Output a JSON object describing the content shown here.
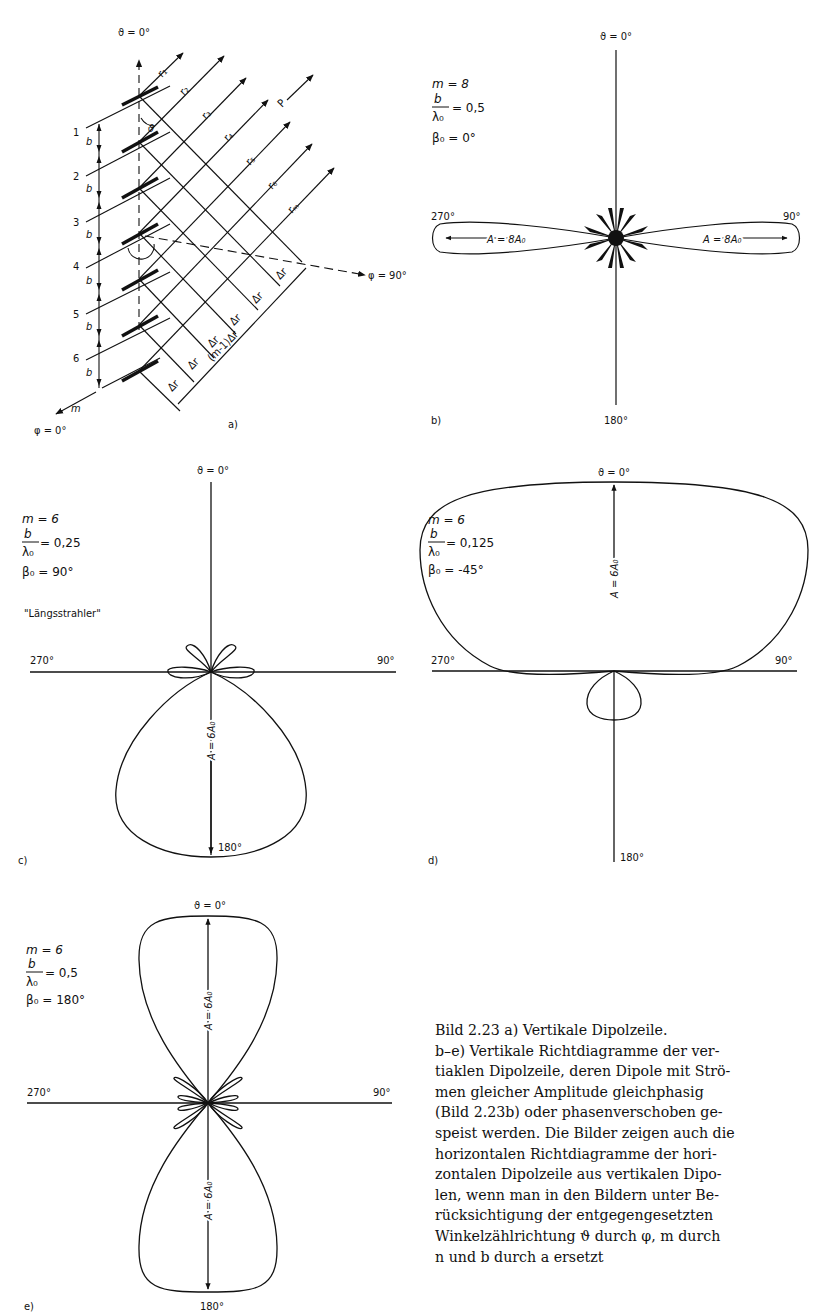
{
  "figure": {
    "number": "Bild 2.23",
    "panels": {
      "a": {
        "label": "a)",
        "theta_axis": "ϑ = 0°",
        "phi_90": "φ = 90°",
        "phi_0": "φ = 0°",
        "element_numbers": [
          "1",
          "2",
          "3",
          "4",
          "5",
          "6"
        ],
        "spacing": "b",
        "last_element": "m",
        "rays": [
          "r1",
          "r2",
          "r3",
          "r4",
          "r5",
          "r6",
          "rm"
        ],
        "ray_labels": [
          "r₁",
          "r₂",
          "r₃",
          "r₄",
          "r₅",
          "r₆",
          "rₘ"
        ],
        "point": "P",
        "angle": "ϑ",
        "delta_r": "Δr",
        "total_path": "(m-1)Δr"
      },
      "b": {
        "label": "b)",
        "top": "ϑ = 0°",
        "right": "90°",
        "bottom": "180°",
        "left": "270°",
        "m": "m = 8",
        "b_over_lambda_num": "b",
        "b_over_lambda_den": "λ₀",
        "b_over_lambda_val": "= 0,5",
        "beta": "β₀ = 0°",
        "amp_left": "A = 8A₀",
        "amp_right": "A = 8A₀"
      },
      "c": {
        "label": "c)",
        "top": "ϑ = 0°",
        "right": "90°",
        "bottom": "180°",
        "left": "270°",
        "m": "m = 6",
        "b_over_lambda_num": "b",
        "b_over_lambda_den": "λ₀",
        "b_over_lambda_val": "= 0,25",
        "beta": "β₀ = 90°",
        "note": "\"Längsstrahler\"",
        "amp": "A = 6A₀"
      },
      "d": {
        "label": "d)",
        "top": "ϑ = 0°",
        "right": "90°",
        "bottom": "180°",
        "left": "270°",
        "m": "m = 6",
        "b_over_lambda_num": "b",
        "b_over_lambda_den": "λ₀",
        "b_over_lambda_val": "= 0,125",
        "beta": "β₀ = -45°",
        "amp": "A = 6A₀"
      },
      "e": {
        "label": "e)",
        "top": "ϑ = 0°",
        "right": "90°",
        "bottom": "180°",
        "left": "270°",
        "m": "m = 6",
        "b_over_lambda_num": "b",
        "b_over_lambda_den": "λ₀",
        "b_over_lambda_val": "= 0,5",
        "beta": "β₀ = 180°",
        "amp_top": "A = 6A₀",
        "amp_bottom": "A = 6A₀"
      }
    },
    "caption_lines": [
      "Bild 2.23  a) Vertikale Dipolzeile.",
      "b–e) Vertikale Richtdiagramme der ver-",
      "tiaklen Dipolzeile, deren Dipole mit Strö-",
      "men gleicher Amplitude gleichphasig",
      "(Bild 2.23b) oder phasenverschoben ge-",
      "speist werden. Die Bilder zeigen auch die",
      "horizontalen Richtdiagramme der hori-",
      "zontalen Dipolzeile aus vertikalen Dipo-",
      "len, wenn man in den Bildern unter Be-",
      "rücksichtigung der entgegengesetzten",
      "Winkelzählrichtung ϑ durch φ, m durch",
      "n und b durch a ersetzt"
    ]
  }
}
